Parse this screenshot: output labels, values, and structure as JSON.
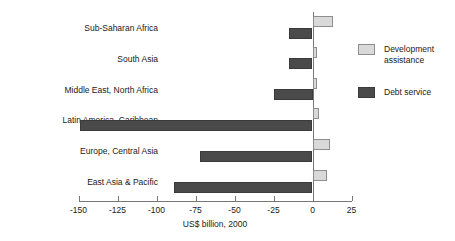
{
  "chart_data": {
    "type": "bar",
    "orientation": "horizontal",
    "title": "",
    "xlabel": "US$ billion, 2000",
    "ylabel": "",
    "xlim": [
      -150,
      25
    ],
    "xticks": [
      -150,
      -125,
      -100,
      -75,
      -50,
      -25,
      0,
      25
    ],
    "xtick_labels": [
      "-150",
      "-125",
      "-100",
      "-75",
      "-50",
      "-25",
      "0",
      "25"
    ],
    "grid": false,
    "legend_position": "right",
    "categories": [
      "Sub-Saharan Africa",
      "South Asia",
      "Middle East, North Africa",
      "Latin America, Caribbean",
      "Europe, Central Asia",
      "East Asia & Pacific"
    ],
    "series": [
      {
        "name": "Development assistance",
        "color": "#d9d9d9",
        "values": [
          13,
          3,
          3,
          4,
          11,
          9
        ]
      },
      {
        "name": "Debt service",
        "color": "#4a4a4a",
        "values": [
          -15,
          -15,
          -25,
          -149,
          -72,
          -89
        ]
      }
    ]
  },
  "legend": {
    "items": [
      {
        "label": "Development\nassistance",
        "swatch": "aid"
      },
      {
        "label": "Debt service",
        "swatch": "debt"
      }
    ]
  },
  "axis": {
    "x_title": "US$ billion, 2000"
  }
}
